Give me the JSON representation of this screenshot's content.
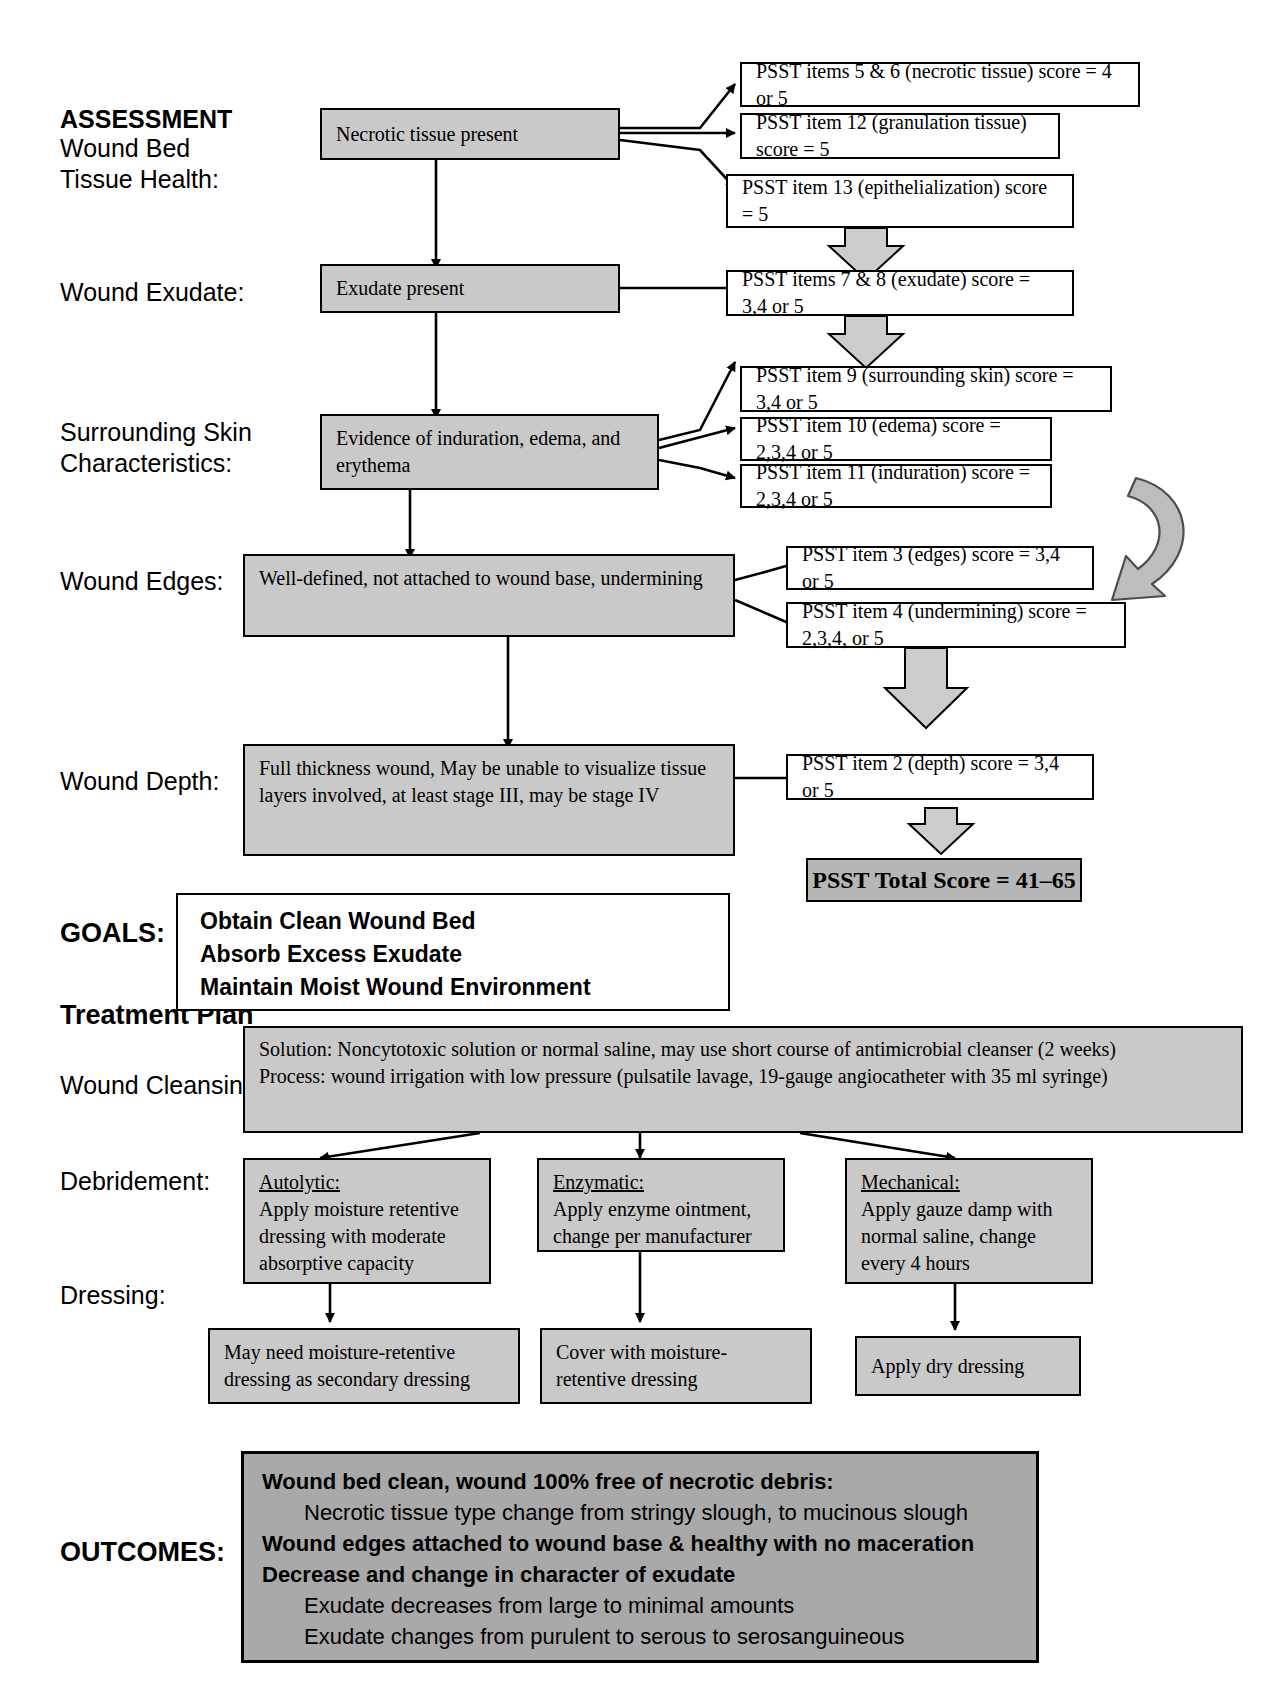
{
  "section_labels": {
    "assessment": "ASSESSMENT",
    "wound_bed_tissue_health": "Wound Bed\nTissue Health:",
    "wound_exudate": "Wound Exudate:",
    "surrounding_skin": "Surrounding Skin\nCharacteristics:",
    "wound_edges": "Wound Edges:",
    "wound_depth": "Wound Depth:",
    "goals": "GOALS:",
    "treatment_plan": "Treatment Plan",
    "wound_cleansing": "Wound Cleansing:",
    "debridement": "Debridement:",
    "dressing": "Dressing:",
    "outcomes": "OUTCOMES:"
  },
  "assessment_findings": {
    "necrotic": "Necrotic tissue present",
    "exudate": "Exudate present",
    "surrounding": "Evidence of induration, edema, and erythema",
    "edges": "Well-defined, not attached to wound base, undermining",
    "depth": "Full thickness wound, May be unable to visualize tissue layers involved, at least stage III, may be stage IV"
  },
  "psst_items": {
    "items_5_6": "PSST items 5 & 6 (necrotic tissue) score = 4 or 5",
    "item_12": "PSST item 12 (granulation tissue) score = 5",
    "item_13": "PSST item 13 (epithelialization) score = 5",
    "items_7_8": "PSST items 7 & 8 (exudate) score = 3,4 or 5",
    "item_9": "PSST item  9 (surrounding skin) score = 3,4 or 5",
    "item_10": "PSST item 10 (edema) score = 2,3,4 or 5",
    "item_11": "PSST item 11 (induration) score = 2,3,4 or 5",
    "item_3": "PSST item 3 (edges) score = 3,4 or 5",
    "item_4": "PSST item 4 (undermining) score = 2,3,4, or 5",
    "item_2": "PSST item 2 (depth) score =  3,4 or 5"
  },
  "total_score": "PSST Total Score = 41–65",
  "goals_list": [
    "Obtain Clean Wound Bed",
    "Absorb Excess Exudate",
    "Maintain Moist Wound Environment"
  ],
  "cleansing": {
    "line1": "Solution: Noncytotoxic solution or normal saline, may use short course of antimicrobial cleanser (2 weeks)",
    "line2": "Process: wound irrigation with low pressure (pulsatile lavage, 19-gauge angiocatheter with 35 ml syringe)"
  },
  "debridement_options": [
    {
      "title": "Autolytic:",
      "body": "Apply moisture retentive dressing with moderate absorptive capacity"
    },
    {
      "title": "Enzymatic:",
      "body": "Apply enzyme ointment, change per manufacturer"
    },
    {
      "title": "Mechanical:",
      "body": "Apply gauze damp with normal saline, change every 4 hours"
    }
  ],
  "dressings": [
    "May need moisture-retentive dressing as secondary dressing",
    "Cover with moisture-retentive dressing",
    "Apply dry dressing"
  ],
  "outcomes_lines": [
    {
      "text": "Wound bed clean, wound 100% free of necrotic debris:",
      "bold": true,
      "indent": false
    },
    {
      "text": "Necrotic tissue type change from stringy slough, to mucinous slough",
      "bold": false,
      "indent": true
    },
    {
      "text": "Wound edges attached to wound base & healthy with no maceration",
      "bold": true,
      "indent": false
    },
    {
      "text": "Decrease and change in character of exudate",
      "bold": true,
      "indent": false
    },
    {
      "text": "Exudate decreases from large to minimal amounts",
      "bold": false,
      "indent": true
    },
    {
      "text": "Exudate changes from purulent to serous to serosanguineous",
      "bold": false,
      "indent": true
    }
  ],
  "colors": {
    "gray_fill": "#c9c9c9",
    "outcome_fill": "#a9a9a9",
    "total_fill": "#b6b6b6",
    "line": "#000000"
  }
}
